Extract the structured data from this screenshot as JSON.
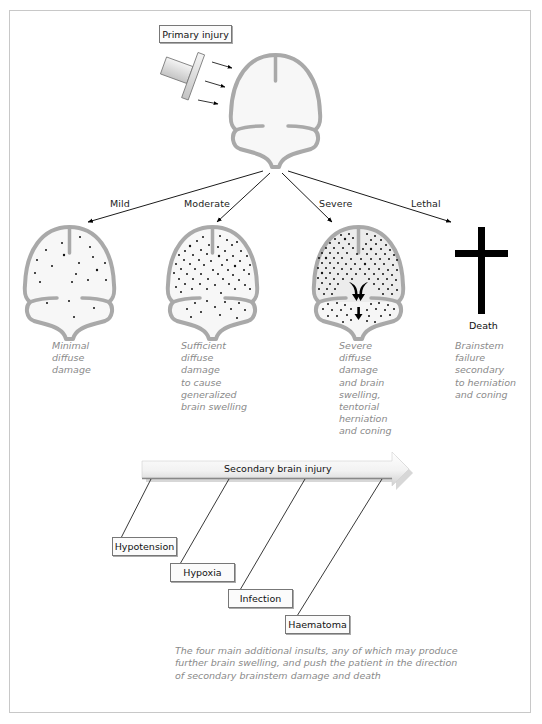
{
  "primary": {
    "label": "Primary injury"
  },
  "branches": [
    {
      "label": "Mild",
      "description": "Minimal\ndiffuse\ndamage"
    },
    {
      "label": "Moderate",
      "description": "Sufficient\ndiffuse\ndamage\nto cause\ngeneralized\nbrain swelling"
    },
    {
      "label": "Severe",
      "description": "Severe\ndiffuse\ndamage\nand brain\nswelling,\ntentorial\nherniation\nand coning"
    },
    {
      "label": "Lethal",
      "description": "Brainstem\nfailure\nsecondary\nto herniation\nand coning"
    }
  ],
  "death": {
    "label": "Death"
  },
  "secondary": {
    "label": "Secondary brain injury",
    "insults": [
      "Hypotension",
      "Hypoxia",
      "Infection",
      "Haematoma"
    ],
    "caption": "The four main additional insults, any of which may produce further brain swelling, and push the patient in the direction of secondary brainstem damage and death"
  },
  "colors": {
    "brain_outline": "#a9a9a9",
    "brain_fill": "#f7f7f7",
    "severe_fill": "#ececec",
    "text_gray": "#8a8a8a",
    "cross": "#000000"
  }
}
